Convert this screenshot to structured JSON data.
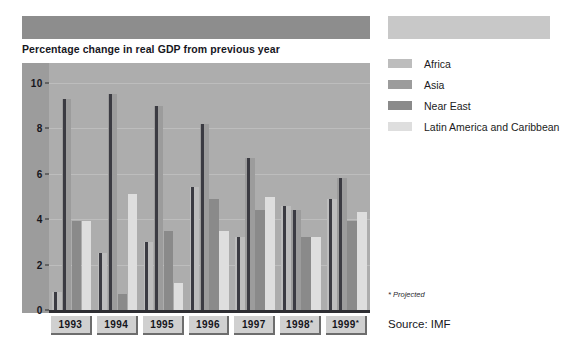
{
  "chart_title": "Percentage change in real GDP from previous year",
  "footnote": "* Projected",
  "source": "Source: IMF",
  "legend": {
    "items": [
      {
        "label": "Africa",
        "color": "#bdbdbd"
      },
      {
        "label": "Asia",
        "color": "#9c9c9c"
      },
      {
        "label": "Near East",
        "color": "#8a8a8a"
      },
      {
        "label": "Latin America and Caribbean",
        "color": "#dedede"
      }
    ]
  },
  "chart_data": {
    "type": "bar",
    "title": "Percentage change in real GDP from previous year",
    "xlabel": "",
    "ylabel": "",
    "ylim": [
      0,
      10
    ],
    "yticks": [
      0,
      2,
      4,
      6,
      8,
      10
    ],
    "grid": true,
    "legend_position": "right",
    "categories": [
      "1993",
      "1994",
      "1995",
      "1996",
      "1997",
      "1998*",
      "1999*"
    ],
    "series": [
      {
        "name": "Africa",
        "color": "#bdbdbd",
        "values": [
          0.8,
          2.5,
          3.0,
          5.4,
          3.2,
          4.6,
          4.9
        ]
      },
      {
        "name": "Asia",
        "color": "#9c9c9c",
        "values": [
          9.3,
          9.5,
          9.0,
          8.2,
          6.7,
          4.4,
          5.8
        ]
      },
      {
        "name": "Near East",
        "color": "#8a8a8a",
        "values": [
          3.9,
          0.7,
          3.5,
          4.9,
          4.4,
          3.2,
          3.9
        ]
      },
      {
        "name": "Latin America and Caribbean",
        "color": "#dedede",
        "values": [
          3.9,
          5.1,
          1.2,
          3.5,
          5.0,
          3.2,
          4.3
        ]
      }
    ],
    "annotations": [
      "* Projected",
      "Source: IMF"
    ]
  }
}
